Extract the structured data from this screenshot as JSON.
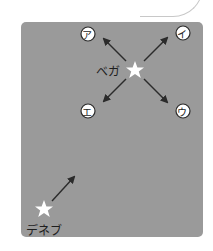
{
  "diagram": {
    "stars": [
      {
        "name": "ベガ",
        "x": 135,
        "y": 70
      },
      {
        "name": "デネブ",
        "x": 44,
        "y": 209
      }
    ],
    "direction_options": [
      {
        "label": "ア",
        "x": 88,
        "y": 34
      },
      {
        "label": "イ",
        "x": 183,
        "y": 33
      },
      {
        "label": "ウ",
        "x": 183,
        "y": 111
      },
      {
        "label": "エ",
        "x": 88,
        "y": 111
      }
    ],
    "colors": {
      "panel": "#9a9a9a",
      "star": "#ffffff",
      "arrow": "#2b2b2b",
      "text": "#1e1e1e"
    }
  }
}
